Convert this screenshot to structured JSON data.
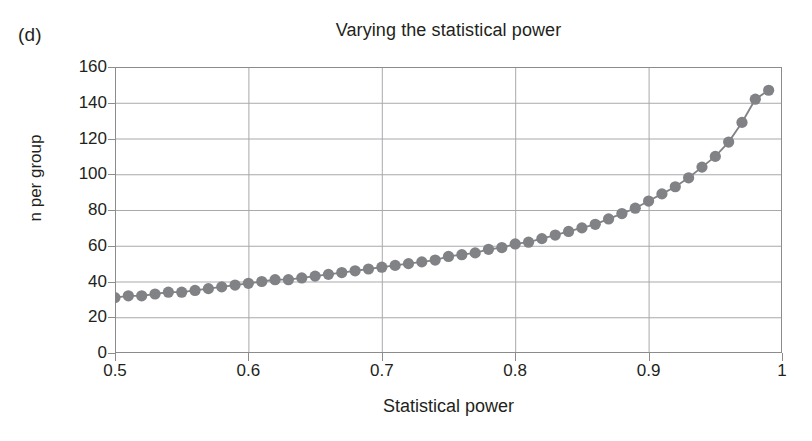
{
  "figure": {
    "panel_label": "(d)",
    "title": "Varying the statistical power",
    "xlabel": "Statistical power",
    "ylabel": "n per group"
  },
  "chart_data": {
    "type": "line",
    "title": "Varying the statistical power",
    "xlabel": "Statistical power",
    "ylabel": "n per group",
    "xlim": [
      0.5,
      1.0
    ],
    "ylim": [
      0,
      160
    ],
    "xticks": [
      0.5,
      0.6,
      0.7,
      0.8,
      0.9,
      1
    ],
    "xtick_labels": [
      "0.5",
      "0.6",
      "0.7",
      "0.8",
      "0.9",
      "1"
    ],
    "yticks": [
      0,
      20,
      40,
      60,
      80,
      100,
      120,
      140,
      160
    ],
    "ytick_labels": [
      "0",
      "20",
      "40",
      "60",
      "80",
      "100",
      "120",
      "140",
      "160"
    ],
    "grid": true,
    "grid_axis": "both",
    "legend": false,
    "marker": "filled-circle",
    "marker_color": "#808285",
    "line_color": "#808285",
    "series": [
      {
        "name": "n per group",
        "x": [
          0.5,
          0.51,
          0.52,
          0.53,
          0.54,
          0.55,
          0.56,
          0.57,
          0.58,
          0.59,
          0.6,
          0.61,
          0.62,
          0.63,
          0.64,
          0.65,
          0.66,
          0.67,
          0.68,
          0.69,
          0.7,
          0.71,
          0.72,
          0.73,
          0.74,
          0.75,
          0.76,
          0.77,
          0.78,
          0.79,
          0.8,
          0.81,
          0.82,
          0.83,
          0.84,
          0.85,
          0.86,
          0.87,
          0.88,
          0.89,
          0.9,
          0.91,
          0.92,
          0.93,
          0.94,
          0.95,
          0.96,
          0.97,
          0.98,
          0.99
        ],
        "y": [
          31,
          32,
          32,
          33,
          34,
          34,
          35,
          36,
          37,
          38,
          39,
          40,
          41,
          41,
          42,
          43,
          44,
          45,
          46,
          47,
          48,
          49,
          50,
          51,
          52,
          54,
          55,
          56,
          58,
          59,
          61,
          62,
          64,
          66,
          68,
          70,
          72,
          75,
          78,
          81,
          85,
          89,
          93,
          98,
          104,
          110,
          118,
          129,
          142,
          147
        ]
      }
    ]
  }
}
